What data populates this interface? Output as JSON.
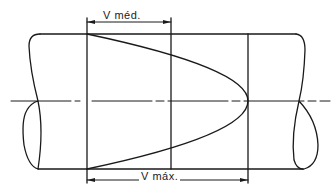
{
  "diagram": {
    "labels": {
      "v_mean": "V méd.",
      "v_max": "V máx."
    },
    "colors": {
      "stroke": "#1a1a1a",
      "background": "#ffffff"
    }
  }
}
